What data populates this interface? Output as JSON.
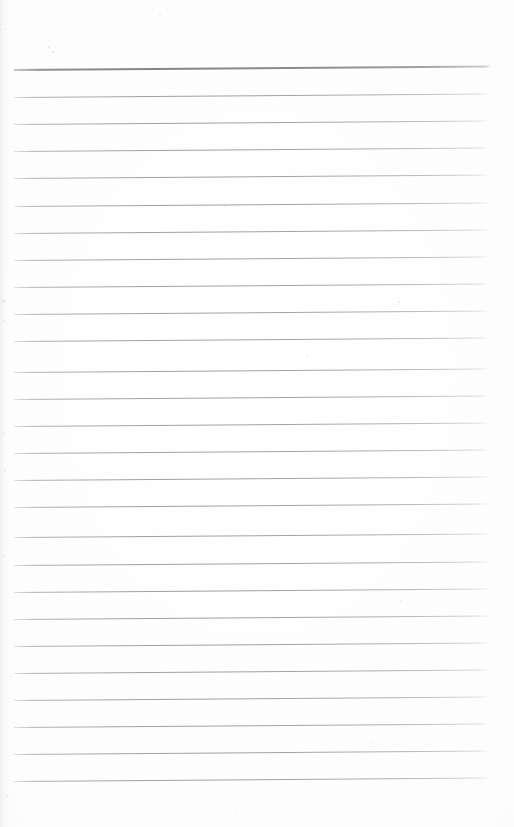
{
  "document": {
    "type": "scanned-lined-paper",
    "title": "Blank Ruled Notebook Page",
    "page_width": 514,
    "page_height": 827,
    "background_color": "#fdfdfd",
    "content_text": "",
    "has_handwriting": false,
    "orientation": "portrait"
  },
  "ruling": {
    "line_count": 27,
    "line_spacing_px": 27,
    "first_line_y": 70,
    "left_margin_x": 14,
    "right_margin_x": 490,
    "line_length_px": 476,
    "tilt_degrees": -0.42,
    "header_rule_color": "#8a8a8f",
    "header_rule_thickness_px": 2,
    "body_rule_color": "#9a9aa1",
    "body_rule_thickness_px": 1,
    "lines": [
      {
        "index": 1,
        "y": 70,
        "weight": "header",
        "text": ""
      },
      {
        "index": 2,
        "y": 97,
        "weight": "normal",
        "text": ""
      },
      {
        "index": 3,
        "y": 124,
        "weight": "normal",
        "text": ""
      },
      {
        "index": 4,
        "y": 151,
        "weight": "normal",
        "text": ""
      },
      {
        "index": 5,
        "y": 178,
        "weight": "normal",
        "text": ""
      },
      {
        "index": 6,
        "y": 206,
        "weight": "normal",
        "text": ""
      },
      {
        "index": 7,
        "y": 233,
        "weight": "normal",
        "text": ""
      },
      {
        "index": 8,
        "y": 260,
        "weight": "normal",
        "text": ""
      },
      {
        "index": 9,
        "y": 287,
        "weight": "normal",
        "text": ""
      },
      {
        "index": 10,
        "y": 314,
        "weight": "normal",
        "text": ""
      },
      {
        "index": 11,
        "y": 341,
        "weight": "normal",
        "text": ""
      },
      {
        "index": 12,
        "y": 372,
        "weight": "normal",
        "text": ""
      },
      {
        "index": 13,
        "y": 399,
        "weight": "normal",
        "text": ""
      },
      {
        "index": 14,
        "y": 426,
        "weight": "normal",
        "text": ""
      },
      {
        "index": 15,
        "y": 453,
        "weight": "normal",
        "text": ""
      },
      {
        "index": 16,
        "y": 480,
        "weight": "normal",
        "text": ""
      },
      {
        "index": 17,
        "y": 507,
        "weight": "normal",
        "text": ""
      },
      {
        "index": 18,
        "y": 537,
        "weight": "normal",
        "text": ""
      },
      {
        "index": 19,
        "y": 565,
        "weight": "normal",
        "text": ""
      },
      {
        "index": 20,
        "y": 592,
        "weight": "normal",
        "text": ""
      },
      {
        "index": 21,
        "y": 619,
        "weight": "normal",
        "text": ""
      },
      {
        "index": 22,
        "y": 646,
        "weight": "normal",
        "text": ""
      },
      {
        "index": 23,
        "y": 673,
        "weight": "normal",
        "text": ""
      },
      {
        "index": 24,
        "y": 700,
        "weight": "normal",
        "text": ""
      },
      {
        "index": 25,
        "y": 727,
        "weight": "normal",
        "text": ""
      },
      {
        "index": 26,
        "y": 754,
        "weight": "normal",
        "text": ""
      },
      {
        "index": 27,
        "y": 781,
        "weight": "normal",
        "text": ""
      }
    ]
  },
  "artifacts": {
    "description": "faint scanner speckles and dust marks",
    "specks": [
      {
        "x": 48,
        "y": 46,
        "size": 2.0,
        "opacity": 0.2
      },
      {
        "x": 159,
        "y": 14,
        "size": 1.6,
        "opacity": 0.14
      },
      {
        "x": 218,
        "y": 30,
        "size": 1.4,
        "opacity": 0.16
      },
      {
        "x": 52,
        "y": 51,
        "size": 1.5,
        "opacity": 0.18
      },
      {
        "x": 5,
        "y": 28,
        "size": 2.4,
        "opacity": 0.16
      },
      {
        "x": 224,
        "y": 205,
        "size": 1.8,
        "opacity": 0.15
      },
      {
        "x": 2,
        "y": 300,
        "size": 2.6,
        "opacity": 0.18
      },
      {
        "x": 398,
        "y": 301,
        "size": 1.7,
        "opacity": 0.17
      },
      {
        "x": 3,
        "y": 320,
        "size": 2.2,
        "opacity": 0.15
      },
      {
        "x": 306,
        "y": 355,
        "size": 1.6,
        "opacity": 0.14
      },
      {
        "x": 2,
        "y": 432,
        "size": 2.0,
        "opacity": 0.13
      },
      {
        "x": 4,
        "y": 470,
        "size": 2.3,
        "opacity": 0.16
      },
      {
        "x": 3,
        "y": 555,
        "size": 2.1,
        "opacity": 0.14
      },
      {
        "x": 400,
        "y": 600,
        "size": 1.5,
        "opacity": 0.12
      },
      {
        "x": 10,
        "y": 676,
        "size": 2.0,
        "opacity": 0.15
      },
      {
        "x": 372,
        "y": 741,
        "size": 1.6,
        "opacity": 0.14
      },
      {
        "x": 18,
        "y": 735,
        "size": 1.8,
        "opacity": 0.13
      },
      {
        "x": 6,
        "y": 795,
        "size": 2.2,
        "opacity": 0.16
      },
      {
        "x": 236,
        "y": 812,
        "size": 1.5,
        "opacity": 0.12
      },
      {
        "x": 120,
        "y": 660,
        "size": 1.4,
        "opacity": 0.11
      }
    ]
  }
}
